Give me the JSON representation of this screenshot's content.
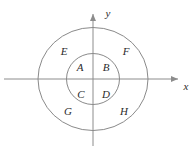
{
  "figure": {
    "type": "venn-concentric-circles-diagram",
    "background_color": "#ffffff",
    "stroke_color": "#8a8a8a",
    "axis_color": "#8c8c8c",
    "text_color": "#2b2b2b",
    "origin": {
      "x": 93,
      "y": 79
    },
    "axes": {
      "x_label": "x",
      "y_label": "y",
      "x_label_pos": {
        "x": 185,
        "y": 86
      },
      "y_label_pos": {
        "x": 108,
        "y": 14
      },
      "x_start": {
        "x": 4,
        "y": 79
      },
      "x_end": {
        "x": 180,
        "y": 79
      },
      "y_start": {
        "x": 93,
        "y": 146
      },
      "y_end": {
        "x": 93,
        "y": 12
      }
    },
    "circles": [
      {
        "name": "outer-circle",
        "cx": 93,
        "cy": 79,
        "rx": 55,
        "ry": 51.5
      },
      {
        "name": "inner-circle",
        "cx": 93,
        "cy": 79,
        "rx": 26.5,
        "ry": 25.5
      }
    ],
    "regions": [
      {
        "id": "A",
        "label": "A",
        "zone": "inner-upper-left",
        "x": 80,
        "y": 68
      },
      {
        "id": "B",
        "label": "B",
        "zone": "inner-upper-right",
        "x": 106,
        "y": 68
      },
      {
        "id": "C",
        "label": "C",
        "zone": "inner-lower-left",
        "x": 81,
        "y": 95
      },
      {
        "id": "D",
        "label": "D",
        "zone": "inner-lower-right",
        "x": 106,
        "y": 95
      },
      {
        "id": "E",
        "label": "E",
        "zone": "annulus-upper-left",
        "x": 64,
        "y": 52
      },
      {
        "id": "F",
        "label": "F",
        "zone": "annulus-upper-right",
        "x": 126,
        "y": 52
      },
      {
        "id": "G",
        "label": "G",
        "zone": "annulus-lower-left",
        "x": 68,
        "y": 112
      },
      {
        "id": "H",
        "label": "H",
        "zone": "annulus-lower-right",
        "x": 124,
        "y": 112
      }
    ]
  }
}
